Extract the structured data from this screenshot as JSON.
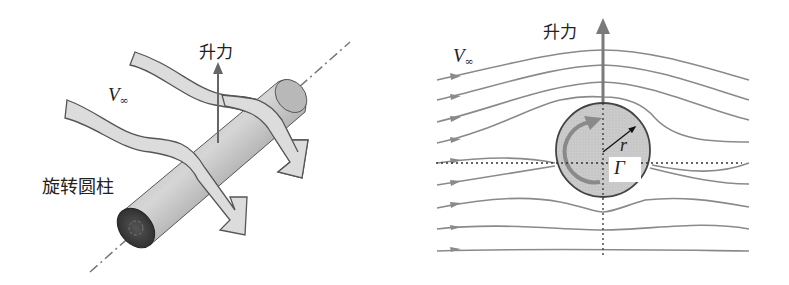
{
  "left_diagram": {
    "title": "rotating cylinder in flow (3D view)",
    "lift_label": "升力",
    "velocity_label": "V",
    "velocity_subscript": "∞",
    "cylinder_label": "旋转圆柱"
  },
  "right_diagram": {
    "title": "streamlines around rotating cylinder (2D)",
    "lift_label": "升力",
    "velocity_label": "V",
    "velocity_subscript": "∞",
    "radius_label": "r",
    "circulation_label": "Γ",
    "streamline_count": 9
  },
  "colors": {
    "streamline": "#8a8a8a",
    "cylinder_fill": "#c8c8c8",
    "outline": "#4a4a4a",
    "lift_arrow": "#7a7a7a",
    "text": "#222222"
  }
}
